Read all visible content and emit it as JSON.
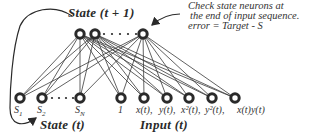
{
  "colors": {
    "ink": "#2a2a2a",
    "node_fill": "#ffffff",
    "background": "#ffffff"
  },
  "labels": {
    "state_next": "State (t + 1)",
    "state_current": "State (t)",
    "input_current": "Input (t)",
    "annotation_line1": "Check state neurons at",
    "annotation_line2": "the end of input sequence.",
    "annotation_line3": "error = Target - S"
  },
  "top_nodes": [
    {
      "id": "t1",
      "x": 80,
      "y": 34
    },
    {
      "id": "t2",
      "x": 95,
      "y": 34
    },
    {
      "id": "tN",
      "x": 143,
      "y": 34
    }
  ],
  "bottom_nodes": [
    {
      "id": "s1",
      "label": "S1",
      "x": 20,
      "y": 98,
      "group": "state"
    },
    {
      "id": "s2",
      "label": "S2",
      "x": 42,
      "y": 98,
      "group": "state"
    },
    {
      "id": "sN",
      "label": "SN",
      "x": 80,
      "y": 98,
      "group": "state"
    },
    {
      "id": "bias",
      "label": "1",
      "x": 121,
      "y": 98,
      "group": "input"
    },
    {
      "id": "x",
      "label": "x(t),",
      "x": 144,
      "y": 98,
      "group": "input"
    },
    {
      "id": "y",
      "label": "y(t),",
      "x": 167,
      "y": 98,
      "group": "input"
    },
    {
      "id": "x2",
      "label": "x²(t),",
      "x": 189,
      "y": 98,
      "group": "input"
    },
    {
      "id": "y2",
      "label": "y²(t),",
      "x": 212,
      "y": 98,
      "group": "input"
    },
    {
      "id": "xy",
      "label": "x(t)y(t)",
      "x": 235,
      "y": 98,
      "group": "input"
    }
  ],
  "ellipsis": "· · · ·"
}
